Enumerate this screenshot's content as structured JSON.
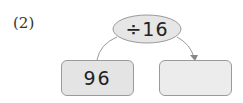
{
  "problem": {
    "label": "(2)",
    "operation": "÷16",
    "input_value": "96",
    "output_value": ""
  },
  "colors": {
    "oval_fill": "#e6e6e6",
    "box_left_fill": "#e4e4e4",
    "box_right_fill": "#ececec",
    "stroke": "#9a9a9a"
  }
}
